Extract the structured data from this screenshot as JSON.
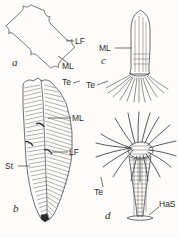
{
  "figure": {
    "background_color": "#fdfcfa",
    "ink_color": "#2b2b2b",
    "panels": [
      {
        "id": "a",
        "letter": "a",
        "description": "rhombic lorica outline in apical view with notched corners",
        "labels": [
          {
            "key": "LF",
            "text": "LF",
            "meaning": "lateral fin"
          },
          {
            "key": "ML",
            "text": "ML",
            "meaning": "median line"
          }
        ]
      },
      {
        "id": "b",
        "letter": "b",
        "description": "hatched conical lorica in lateral view tapering to a stalk",
        "labels": [
          {
            "key": "Te",
            "text": "Te",
            "meaning": "tentacle"
          },
          {
            "key": "ML",
            "text": "ML",
            "meaning": "median line"
          },
          {
            "key": "LF",
            "text": "LF",
            "meaning": "lateral fin"
          },
          {
            "key": "St",
            "text": "St",
            "meaning": "stalk"
          }
        ]
      },
      {
        "id": "c",
        "letter": "c",
        "description": "elongate bullet-shaped body with basal fringe of fine tentacles",
        "labels": [
          {
            "key": "ML",
            "text": "ML",
            "meaning": "median line"
          },
          {
            "key": "Te",
            "text": "Te",
            "meaning": "tentacle"
          }
        ]
      },
      {
        "id": "d",
        "letter": "d",
        "description": "conical body crowned by a radiating whorl of tentacles, ending in a holdfast",
        "labels": [
          {
            "key": "Te",
            "text": "Te",
            "meaning": "tentacle"
          },
          {
            "key": "HaS",
            "text": "HaS",
            "meaning": "haptic / holdfast structure"
          }
        ]
      }
    ]
  },
  "text": {
    "a_letter": "a",
    "b_letter": "b",
    "c_letter": "c",
    "d_letter": "d",
    "a_LF": "LF",
    "a_ML": "ML",
    "b_Te": "Te",
    "b_ML": "ML",
    "b_LF": "LF",
    "b_St": "St",
    "c_ML": "ML",
    "c_Te": "Te",
    "d_Te": "Te",
    "d_HaS": "HaS"
  }
}
